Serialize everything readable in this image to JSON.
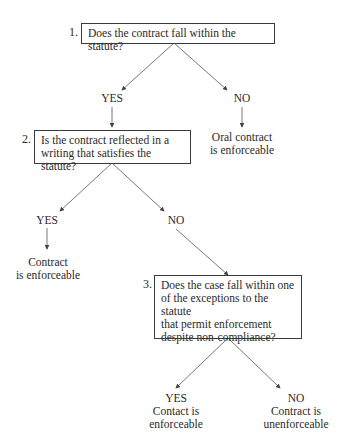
{
  "diagram": {
    "type": "decision-tree",
    "q1": {
      "number": "1.",
      "text": "Does the contract fall within the statute?"
    },
    "q1_yes": "YES",
    "q1_no": "NO",
    "q1_no_outcome_l1": "Oral contract",
    "q1_no_outcome_l2": "is enforceable",
    "q2": {
      "number": "2.",
      "line1": "Is the contract reflected in a",
      "line2": "writing that satisfies the statute?"
    },
    "q2_yes": "YES",
    "q2_no": "NO",
    "q2_yes_outcome_l1": "Contract",
    "q2_yes_outcome_l2": "is enforceable",
    "q3": {
      "number": "3.",
      "line1": "Does the case fall within one",
      "line2": "of the exceptions to the statute",
      "line3": "that permit enforcement",
      "line4": "despite non-compliance?"
    },
    "q3_yes": "YES",
    "q3_yes_outcome_l1": "Contact is",
    "q3_yes_outcome_l2": "enforceable",
    "q3_no": "NO",
    "q3_no_outcome_l1": "Contract is",
    "q3_no_outcome_l2": "unenforceable",
    "line_color": "#555555"
  }
}
